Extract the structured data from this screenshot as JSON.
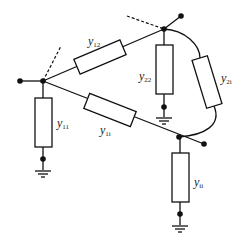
{
  "diagram": {
    "type": "node admittance network",
    "nodes": [
      {
        "id": "1",
        "role": "left bus node"
      },
      {
        "id": "2",
        "role": "top bus node"
      },
      {
        "id": "i",
        "role": "bottom-right bus node"
      }
    ],
    "branches": [
      {
        "id": "y12",
        "label": "y",
        "sub": "12",
        "from": "1",
        "to": "2"
      },
      {
        "id": "y1i",
        "label": "y",
        "sub": "1i",
        "from": "1",
        "to": "i"
      },
      {
        "id": "y2i",
        "label": "y",
        "sub": "2i",
        "from": "2",
        "to": "i"
      }
    ],
    "shunts": [
      {
        "id": "y11",
        "label": "y",
        "sub": "11",
        "node": "1"
      },
      {
        "id": "y22",
        "label": "y",
        "sub": "22",
        "node": "2"
      },
      {
        "id": "yii",
        "label": "y",
        "sub": "ii",
        "node": "i"
      }
    ],
    "colors": {
      "line": "#111111",
      "background": "#ffffff"
    }
  }
}
